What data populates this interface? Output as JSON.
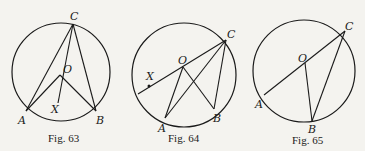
{
  "figures": [
    {
      "caption": "Fig. 63",
      "labels": {
        "C": "C",
        "O": "O",
        "X": "X",
        "A": "A",
        "B": "B"
      },
      "points": {
        "center": [
          61,
          80
        ],
        "radius": 50,
        "C": [
          73,
          24
        ],
        "O": [
          60,
          75
        ],
        "X": [
          55,
          105
        ],
        "A": [
          26,
          111
        ],
        "B": [
          96,
          111
        ]
      }
    },
    {
      "caption": "Fig. 64",
      "labels": {
        "C": "C",
        "O": "O",
        "X": "X",
        "A": "A",
        "B": "B"
      },
      "points": {
        "center": [
          184,
          75
        ],
        "radius": 52,
        "C": [
          226,
          40
        ],
        "O": [
          183,
          67
        ],
        "X": [
          149,
          86
        ],
        "A": [
          165,
          118
        ],
        "B": [
          214,
          109
        ],
        "D": [
          137,
          94
        ]
      }
    },
    {
      "caption": "Fig. 65",
      "labels": {
        "C": "C",
        "O": "O",
        "A": "A",
        "B": "B"
      },
      "points": {
        "center": [
          304,
          70
        ],
        "radius": 50,
        "C": [
          345,
          30
        ],
        "O": [
          305,
          65
        ],
        "A": [
          263,
          95
        ],
        "B": [
          312,
          119
        ]
      }
    }
  ]
}
